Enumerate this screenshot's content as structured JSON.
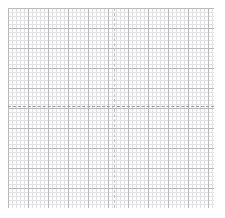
{
  "figure": {
    "title": "",
    "subtitle": "",
    "background_color": "#ffffff"
  },
  "grid": {
    "minor_color": "#e2e2e6",
    "major_color": "#b9b9bd",
    "minor_spacing_px": 4,
    "major_spacing_px": 20,
    "area_left_px": 8,
    "area_top_px": 8,
    "area_width_px": 206,
    "area_height_px": 200,
    "show_minor": "on",
    "show_major": "on"
  },
  "axes": {
    "x_axis": {
      "label": "",
      "zero_line_style": "dashed",
      "zero_line_color": "#9a9a9f",
      "zero_line_y_px": 106,
      "tick_labels": []
    },
    "y_axis": {
      "label": "",
      "zero_line_style": "dashed",
      "zero_line_color": "#c2c2c6",
      "zero_line_x_px": 114,
      "tick_labels": []
    }
  },
  "chart_data": {
    "type": "line",
    "title": "",
    "xlabel": "",
    "ylabel": "",
    "series": [],
    "x": [],
    "categories": [],
    "values": [],
    "xlim": [
      -10.6,
      9.9
    ],
    "ylim": [
      -10.1,
      9.8
    ],
    "grid": "on",
    "legend": "none",
    "annotations": []
  }
}
